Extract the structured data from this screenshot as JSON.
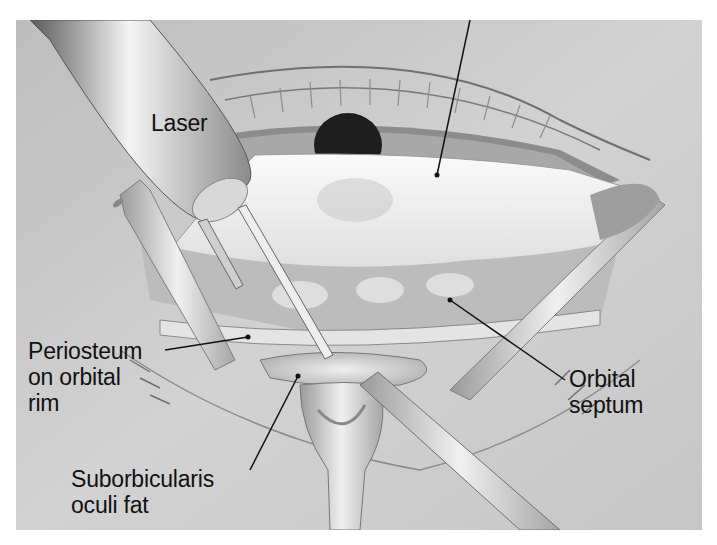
{
  "figure": {
    "type": "medical-illustration",
    "labels": {
      "laser": "Laser",
      "periosteum": "Periosteum\non orbital\nrim",
      "suborbicularis": "Suborbicularis\noculi fat",
      "orbital_septum": "Orbital\nseptum"
    },
    "colors": {
      "background": "#c9c9c9",
      "page": "#ffffff",
      "leader_line": "#111111",
      "pupil": "#1e1e1e"
    }
  }
}
